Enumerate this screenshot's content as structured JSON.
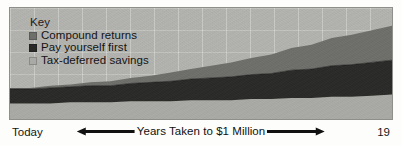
{
  "figure": {
    "background_color": "#fdfdfb",
    "plot_background_color": "#b2b2ae",
    "frame_color": "#8e8e8a"
  },
  "legend": {
    "title": "Key",
    "items": [
      {
        "label": "Compound returns",
        "swatch_icon": "square-swatch-icon",
        "color": "#6e6e6b"
      },
      {
        "label": "Pay yourself first",
        "swatch_icon": "square-swatch-icon",
        "color": "#2a2a28"
      },
      {
        "label": "Tax-deferred savings",
        "swatch_icon": "square-swatch-icon",
        "color": "#a9a9a5"
      }
    ]
  },
  "axis": {
    "left_label": "Today",
    "right_label": "19",
    "center_label": "Years Taken to $1 Million",
    "left_arrow_icon": "arrow-left-icon",
    "right_arrow_icon": "arrow-right-icon"
  },
  "chart_data": {
    "type": "area",
    "title": "",
    "subtitle": "",
    "xlabel": "Years Taken to $1 Million",
    "ylabel": "",
    "grid": true,
    "legend_position": "top-left",
    "stacked": true,
    "xlim": [
      0,
      19
    ],
    "ylim": [
      0,
      1
    ],
    "x": [
      0,
      1,
      2,
      3,
      4,
      5,
      6,
      7,
      8,
      9,
      10,
      11,
      12,
      13,
      14,
      15,
      16,
      17,
      18,
      19
    ],
    "xtick_labels": [
      "Today",
      "19"
    ],
    "series": [
      {
        "name": "Tax-deferred savings",
        "color": "#a9a9a5",
        "values": [
          0.14,
          0.14,
          0.14,
          0.15,
          0.15,
          0.15,
          0.16,
          0.16,
          0.16,
          0.17,
          0.17,
          0.17,
          0.18,
          0.18,
          0.19,
          0.19,
          0.2,
          0.2,
          0.21,
          0.22
        ]
      },
      {
        "name": "Pay yourself first",
        "color": "#2a2a28",
        "values": [
          0.13,
          0.13,
          0.14,
          0.14,
          0.15,
          0.15,
          0.16,
          0.17,
          0.18,
          0.19,
          0.2,
          0.21,
          0.22,
          0.23,
          0.25,
          0.26,
          0.28,
          0.29,
          0.3,
          0.31
        ]
      },
      {
        "name": "Compound returns",
        "color": "#6e6e6b",
        "values": [
          0.01,
          0.01,
          0.02,
          0.02,
          0.03,
          0.04,
          0.05,
          0.06,
          0.08,
          0.09,
          0.11,
          0.13,
          0.15,
          0.17,
          0.2,
          0.22,
          0.25,
          0.27,
          0.29,
          0.31
        ]
      }
    ],
    "annotations": []
  }
}
